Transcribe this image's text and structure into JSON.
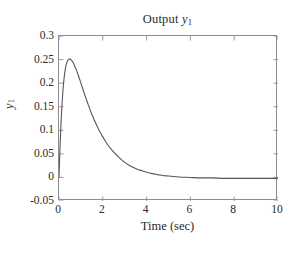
{
  "chart_data": {
    "type": "line",
    "title_text": "Output",
    "title_var": "y",
    "title_sub": "1",
    "xlabel": "Time (sec)",
    "ylabel": "y₁",
    "ylabel_var": "y",
    "ylabel_sub": "1",
    "xlim": [
      0,
      10
    ],
    "ylim": [
      -0.05,
      0.3
    ],
    "xticks": [
      0,
      2,
      4,
      6,
      8,
      10
    ],
    "xtick_labels": [
      "0",
      "2",
      "4",
      "6",
      "8",
      "10"
    ],
    "yticks": [
      -0.05,
      0,
      0.05,
      0.1,
      0.15,
      0.2,
      0.25,
      0.3
    ],
    "ytick_labels": [
      "-0.05",
      "0",
      "0.05",
      "0.1",
      "0.15",
      "0.2",
      "0.25",
      "0.3"
    ],
    "grid": false,
    "legend": false,
    "line_color": "#555555",
    "axis_color": "#8d8d8d",
    "background": "#ffffff",
    "peak": {
      "x": 0.52,
      "y": 0.251
    },
    "series": [
      {
        "name": "y1",
        "x": [
          0.0,
          0.05,
          0.1,
          0.15,
          0.2,
          0.25,
          0.3,
          0.35,
          0.4,
          0.45,
          0.5,
          0.55,
          0.6,
          0.65,
          0.7,
          0.8,
          0.9,
          1.0,
          1.1,
          1.2,
          1.3,
          1.4,
          1.5,
          1.6,
          1.7,
          1.8,
          1.9,
          2.0,
          2.2,
          2.4,
          2.6,
          2.8,
          3.0,
          3.2,
          3.4,
          3.6,
          3.8,
          4.0,
          4.25,
          4.5,
          4.75,
          5.0,
          5.5,
          6.0,
          6.5,
          7.0,
          7.5,
          8.0,
          8.5,
          9.0,
          9.5,
          10.0
        ],
        "y": [
          0.0,
          0.068,
          0.123,
          0.164,
          0.195,
          0.218,
          0.233,
          0.243,
          0.248,
          0.251,
          0.251,
          0.25,
          0.247,
          0.243,
          0.238,
          0.227,
          0.214,
          0.2,
          0.186,
          0.172,
          0.159,
          0.146,
          0.134,
          0.123,
          0.113,
          0.103,
          0.094,
          0.086,
          0.071,
          0.059,
          0.049,
          0.04,
          0.032,
          0.026,
          0.021,
          0.017,
          0.014,
          0.011,
          0.008,
          0.006,
          0.004,
          0.003,
          0.001,
          0.0,
          -0.001,
          -0.001,
          -0.002,
          -0.002,
          -0.002,
          -0.002,
          -0.002,
          -0.002
        ]
      }
    ]
  },
  "caption_remnant": ""
}
